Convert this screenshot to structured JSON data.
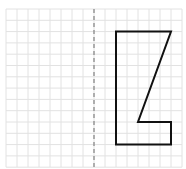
{
  "diagram": {
    "type": "grid-reflection",
    "grid": {
      "columns": 16,
      "rows": 14
    },
    "mirror_line": {
      "style": "dashed",
      "column": 8,
      "color": "#8a8a8a"
    },
    "grid_color": "#e2e2e2",
    "shape": {
      "name": "polygon",
      "stroke": "#111111",
      "vertices": [
        [
          10,
          2
        ],
        [
          15,
          2
        ],
        [
          12,
          10
        ],
        [
          15,
          10
        ],
        [
          15,
          12
        ],
        [
          10,
          12
        ]
      ]
    }
  }
}
